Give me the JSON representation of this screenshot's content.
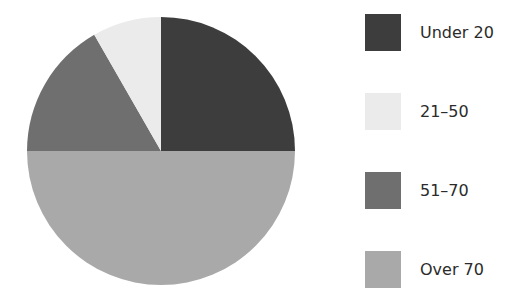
{
  "chart_data": {
    "type": "pie",
    "title": "",
    "categories": [
      "Under 20",
      "21–50",
      "51–70",
      "Over 70"
    ],
    "values": [
      25,
      8.3,
      16.7,
      50
    ],
    "unit": "percent (estimated from slice angles)",
    "colors": [
      "#3d3d3d",
      "#ebebeb",
      "#6f6f6f",
      "#a9a9a9"
    ],
    "start_angle_deg": 0,
    "direction": "counterclockwise-from-top for 21-50 and 51-70; Under 20 occupies top-right quadrant; Over 70 occupies bottom half",
    "legend_position": "right"
  },
  "legend": {
    "items": [
      {
        "label": "Under 20",
        "color": "#3d3d3d"
      },
      {
        "label": "21–50",
        "color": "#ebebeb"
      },
      {
        "label": "51–70",
        "color": "#6f6f6f"
      },
      {
        "label": "Over 70",
        "color": "#a9a9a9"
      }
    ]
  }
}
